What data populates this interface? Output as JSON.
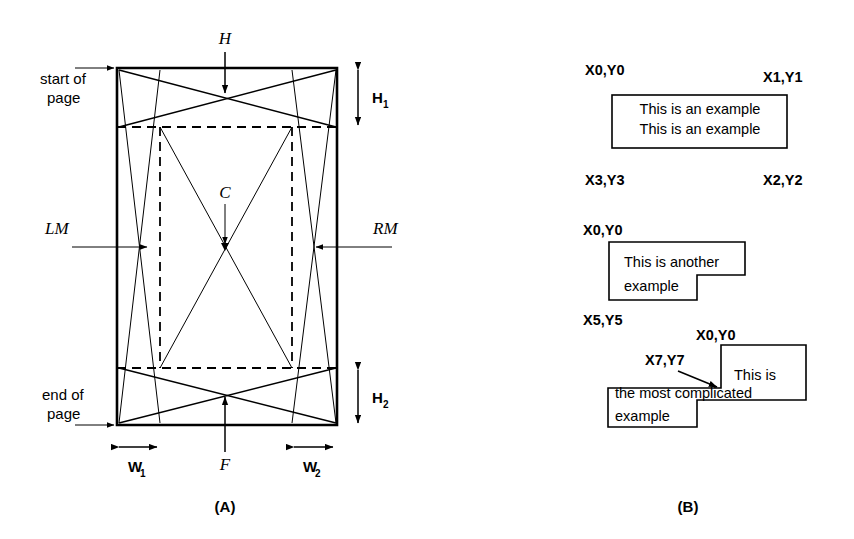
{
  "figure": {
    "panel_a": {
      "caption": "(A)",
      "labels": {
        "header": "H",
        "footer": "F",
        "center": "C",
        "left_margin": "LM",
        "right_margin": "RM",
        "start_of_page_line1": "start of",
        "start_of_page_line2": "page",
        "end_of_page_line1": "end of",
        "end_of_page_line2": "page",
        "h1_base": "H",
        "h1_sub": "1",
        "h2_base": "H",
        "h2_sub": "2",
        "w1_base": "W",
        "w1_sub": "1",
        "w2_base": "W",
        "w2_sub": "2"
      }
    },
    "panel_b": {
      "caption": "(B)",
      "example1": {
        "corner_top_left": "X0,Y0",
        "corner_top_right": "X1,Y1",
        "corner_bottom_left": "X3,Y3",
        "corner_bottom_right": "X2,Y2",
        "text_line1": "This is an example",
        "text_line2": "This is an example"
      },
      "example2": {
        "corner_top_left": "X0,Y0",
        "corner_bottom_left": "X5,Y5",
        "text_line1": "This is another",
        "text_line2": "example"
      },
      "example3": {
        "corner_top_left": "X0,Y0",
        "corner_notch": "X7,Y7",
        "text_line1": "This is",
        "text_line2": "the most complicated",
        "text_line3": "example"
      }
    }
  },
  "colors": {
    "ink": "#000000",
    "paper": "#ffffff"
  }
}
